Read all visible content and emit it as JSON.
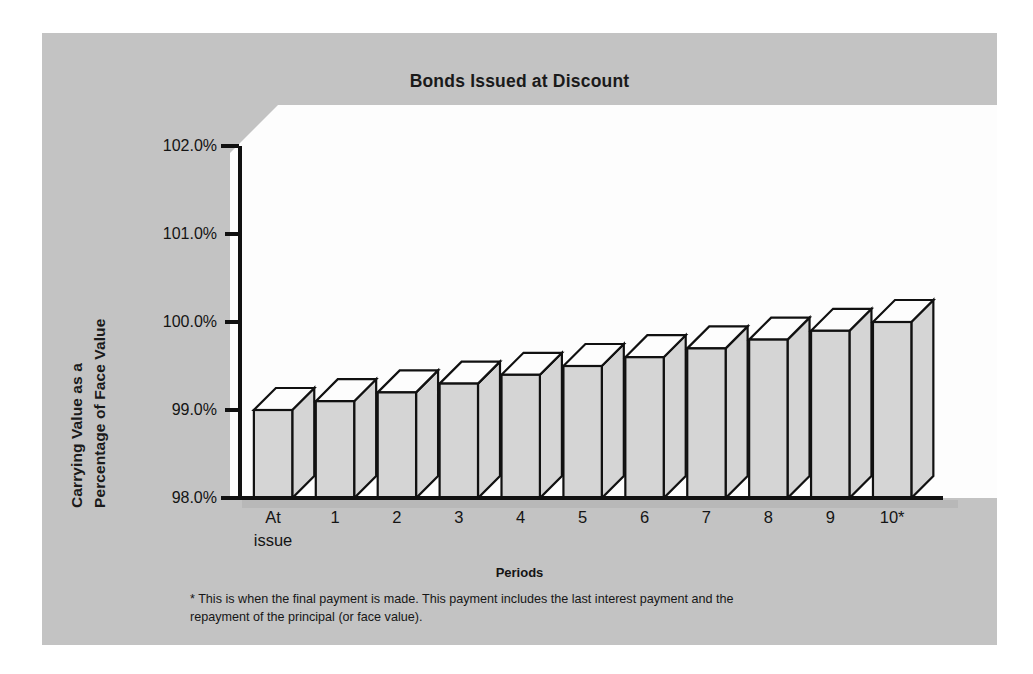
{
  "figure": {
    "background_color": "#c3c3c3",
    "plot_background_color": "#fdfdfd",
    "bar_face_color": "#d5d5d5",
    "bar_top_color": "#fdfdfd",
    "bar_edge_color": "#111111"
  },
  "chart_data": {
    "type": "bar",
    "title": "Bonds Issued at Discount",
    "xlabel": "Periods",
    "ylabel": "Carrying Value as a Percentage of Face Value",
    "ylabel_lines": [
      "Carrying Value as a",
      "Percentage of Face Value"
    ],
    "categories": [
      "At\nissue",
      "1",
      "2",
      "3",
      "4",
      "5",
      "6",
      "7",
      "8",
      "9",
      "10*"
    ],
    "values": [
      99.0,
      99.1,
      99.2,
      99.3,
      99.4,
      99.5,
      99.6,
      99.7,
      99.8,
      99.9,
      100.0
    ],
    "ylim": [
      98.0,
      102.0
    ],
    "yticks": [
      98.0,
      99.0,
      100.0,
      101.0,
      102.0
    ],
    "ytick_labels": [
      "98.0%",
      "99.0%",
      "100.0%",
      "101.0%",
      "102.0%"
    ],
    "grid": false,
    "legend": null,
    "style": "3d-bar",
    "annotations": [
      "* This is when the final payment is made. This payment includes the last interest payment and the repayment of the principal (or face value)."
    ]
  },
  "footnote": {
    "line1": "* This is when the final payment is made. This payment includes the last interest payment and the",
    "line2": "repayment of the principal (or face value)."
  }
}
